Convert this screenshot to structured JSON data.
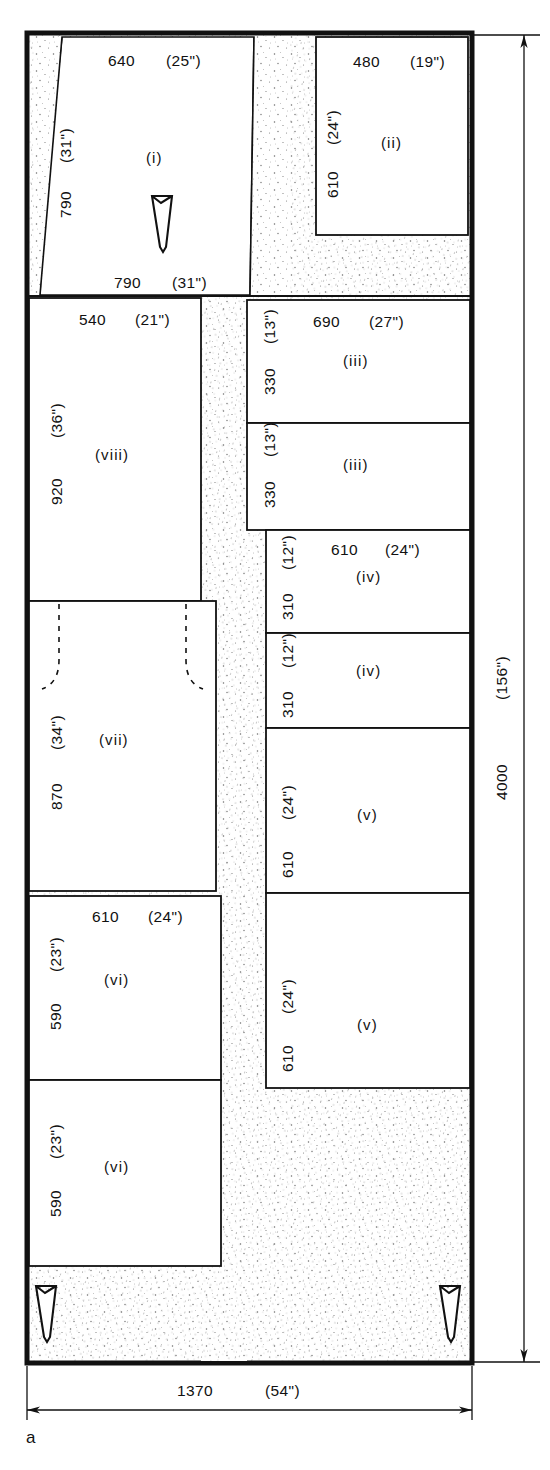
{
  "figure": {
    "caption": "a",
    "overall_width_label": "1370",
    "overall_width_imperial": "(54\")",
    "overall_height_label": "4000",
    "overall_height_imperial": "(156\")"
  },
  "rooms": [
    {
      "id": "i",
      "name": "(i)",
      "top_dim": "640",
      "top_dim_imperial": "(25\")",
      "bottom_dim": "790",
      "bottom_dim_imperial": "(31\")",
      "left_dim": "790",
      "left_dim_imperial": "(31\")"
    },
    {
      "id": "ii",
      "name": "(ii)",
      "top_dim": "480",
      "top_dim_imperial": "(19\")",
      "left_dim": "610",
      "left_dim_imperial": "(24\")"
    },
    {
      "id": "iii-upper",
      "name": "(iii)",
      "top_dim": "690",
      "top_dim_imperial": "(27\")",
      "left_dim": "330",
      "left_dim_imperial": "(13\")"
    },
    {
      "id": "iii-lower",
      "name": "(iii)",
      "left_dim": "330",
      "left_dim_imperial": "(13\")"
    },
    {
      "id": "iv-upper",
      "name": "(iv)",
      "top_dim": "610",
      "top_dim_imperial": "(24\")",
      "left_dim": "310",
      "left_dim_imperial": "(12\")"
    },
    {
      "id": "iv-lower",
      "name": "(iv)",
      "left_dim": "310",
      "left_dim_imperial": "(12\")"
    },
    {
      "id": "v-upper",
      "name": "(v)",
      "left_dim": "610",
      "left_dim_imperial": "(24\")"
    },
    {
      "id": "v-lower",
      "name": "(v)",
      "left_dim": "610",
      "left_dim_imperial": "(24\")"
    },
    {
      "id": "vi-upper",
      "name": "(vi)",
      "top_dim": "610",
      "top_dim_imperial": "(24\")",
      "left_dim": "590",
      "left_dim_imperial": "(23\")"
    },
    {
      "id": "vi-lower",
      "name": "(vi)",
      "left_dim": "590",
      "left_dim_imperial": "(23\")"
    },
    {
      "id": "vii",
      "name": "(vii)",
      "left_dim": "870",
      "left_dim_imperial": "(34\")"
    },
    {
      "id": "viii",
      "name": "(viii)",
      "top_dim": "540",
      "top_dim_imperial": "(21\")",
      "left_dim": "920",
      "left_dim_imperial": "(36\")"
    }
  ],
  "colors": {
    "ink": "#111111",
    "wall": "#1a1a1a",
    "hatch": "#f2f2f2",
    "paper": "#ffffff"
  }
}
